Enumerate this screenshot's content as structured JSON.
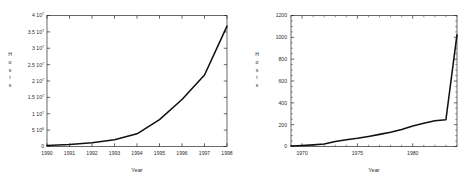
{
  "figure": {
    "background_color": "#ffffff",
    "line_color": "#111111",
    "axis_color": "#2a2a2a"
  },
  "charts": [
    {
      "id": "hosts-1990-1998",
      "position": "left",
      "axis_titles": {
        "x": "Year",
        "y": "Hosts"
      },
      "y_axis_letters": [
        "H",
        "o",
        "s",
        "t",
        "s"
      ],
      "y_tick_labels": [
        {
          "mantissa": "4",
          "base": "10",
          "exponent": "7",
          "value": 40000000
        },
        {
          "mantissa": "3.5",
          "base": "10",
          "exponent": "7",
          "value": 35000000
        },
        {
          "mantissa": "3",
          "base": "10",
          "exponent": "7",
          "value": 30000000
        },
        {
          "mantissa": "2.5",
          "base": "10",
          "exponent": "7",
          "value": 25000000
        },
        {
          "mantissa": "2",
          "base": "10",
          "exponent": "7",
          "value": 20000000
        },
        {
          "mantissa": "1.5",
          "base": "10",
          "exponent": "7",
          "value": 15000000
        },
        {
          "mantissa": "1",
          "base": "10",
          "exponent": "7",
          "value": 10000000
        },
        {
          "mantissa": "5",
          "base": "10",
          "exponent": "6",
          "value": 5000000
        },
        {
          "mantissa": "0",
          "base": "",
          "exponent": "",
          "value": 0
        }
      ],
      "x_tick_labels": [
        "1990",
        "1991",
        "1992",
        "1993",
        "1994",
        "1995",
        "1996",
        "1997",
        "1998"
      ]
    },
    {
      "id": "hosts-1969-1984",
      "position": "right",
      "axis_titles": {
        "x": "Year",
        "y": "Hosts"
      },
      "y_axis_letters": [
        "H",
        "o",
        "s",
        "t",
        "s"
      ],
      "y_tick_labels": [
        "1200",
        "1000",
        "800",
        "600",
        "400",
        "200",
        "0"
      ],
      "x_tick_labels": [
        "1970",
        "1975",
        "1980"
      ]
    }
  ],
  "chart_data": [
    {
      "type": "line",
      "title": "",
      "xlabel": "Year",
      "ylabel": "Hosts",
      "xlim": [
        1990,
        1998
      ],
      "ylim": [
        0,
        40000000
      ],
      "grid": false,
      "legend": "none",
      "x": [
        1990,
        1991,
        1992,
        1993,
        1994,
        1995,
        1996,
        1997,
        1998
      ],
      "values": [
        313000,
        617000,
        1136000,
        2056000,
        3864000,
        8200000,
        14352000,
        21819000,
        36739000
      ],
      "y_ticks": [
        0,
        5000000,
        10000000,
        15000000,
        20000000,
        25000000,
        30000000,
        35000000,
        40000000
      ],
      "x_ticks": [
        1990,
        1991,
        1992,
        1993,
        1994,
        1995,
        1996,
        1997,
        1998
      ]
    },
    {
      "type": "line",
      "title": "",
      "xlabel": "Year",
      "ylabel": "Hosts",
      "xlim": [
        1969,
        1984
      ],
      "ylim": [
        0,
        1200
      ],
      "grid": false,
      "legend": "none",
      "x": [
        1969,
        1970,
        1971,
        1972,
        1973,
        1974,
        1975,
        1976,
        1977,
        1978,
        1979,
        1980,
        1981,
        1982,
        1983,
        1984
      ],
      "values": [
        4,
        9,
        15,
        23,
        45,
        62,
        75,
        92,
        111,
        130,
        156,
        188,
        213,
        235,
        245,
        1024
      ],
      "y_ticks": [
        0,
        200,
        400,
        600,
        800,
        1000,
        1200
      ],
      "x_ticks": [
        1970,
        1975,
        1980
      ]
    }
  ]
}
